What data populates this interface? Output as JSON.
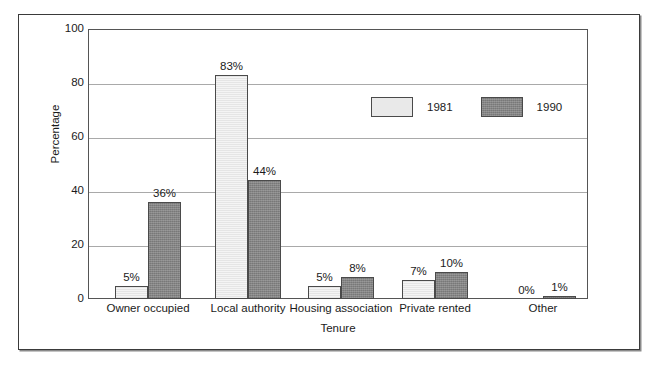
{
  "chart_data": {
    "type": "bar",
    "title": "",
    "subtitle": "",
    "xlabel": "Tenure",
    "ylabel": "Percentage",
    "categories": [
      "Owner occupied",
      "Local authority",
      "Housing association",
      "Private rented",
      "Other"
    ],
    "series": [
      {
        "name": "1981",
        "color": "#e9e9e9",
        "values": [
          5,
          83,
          5,
          7,
          0
        ]
      },
      {
        "name": "1990",
        "color": "#858585",
        "values": [
          36,
          44,
          8,
          10,
          1
        ]
      }
    ],
    "data_labels": [
      [
        "5%",
        "83%",
        "5%",
        "7%",
        "0%"
      ],
      [
        "36%",
        "44%",
        "8%",
        "10%",
        "1%"
      ]
    ],
    "ylim": [
      0,
      100
    ],
    "yticks": [
      "100",
      "80",
      "60",
      "40",
      "20",
      "0"
    ],
    "ytick_values": [
      100,
      80,
      60,
      40,
      20,
      0
    ],
    "grid": "horizontal",
    "legend_position": "upper-right-inside",
    "legend": [
      "1981",
      "1990"
    ]
  },
  "figure": {
    "frame_color": "#3a3a3a",
    "plot_border_color": "#555555",
    "gridline_color": "#a9a9a9",
    "background": "#ffffff"
  }
}
